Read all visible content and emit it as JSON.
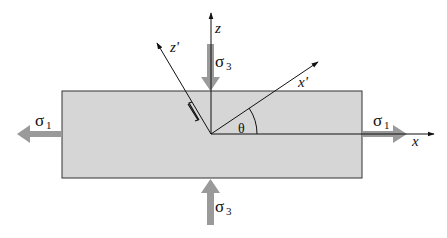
{
  "diagram": {
    "type": "stress-state-block",
    "colors": {
      "block_fill": "#d6d6d6",
      "block_stroke": "#333333",
      "stress_arrow": "#9a9a9a",
      "axis": "#111111"
    },
    "axes": {
      "x": "x",
      "z": "z",
      "x_prime": "x'",
      "z_prime": "z'",
      "angle": "θ"
    },
    "stresses": {
      "sigma1_left": {
        "symbol": "σ",
        "subscript": "1"
      },
      "sigma1_right": {
        "symbol": "σ",
        "subscript": "1"
      },
      "sigma3_top": {
        "symbol": "σ",
        "subscript": "3"
      },
      "sigma3_bottom": {
        "symbol": "σ",
        "subscript": "3"
      }
    },
    "shear_sense_marker": "⇅"
  }
}
